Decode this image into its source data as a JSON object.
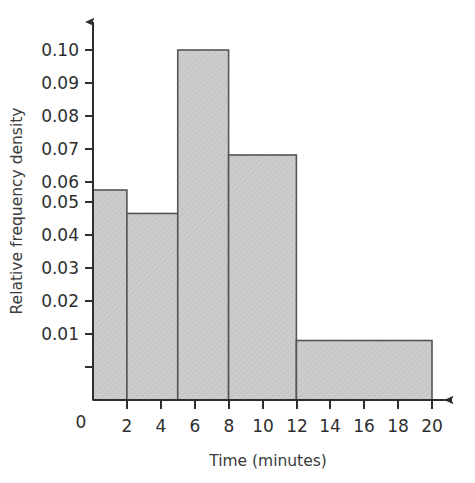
{
  "chart_data": {
    "type": "bar",
    "title": "",
    "subtitle": "",
    "xlabel": "Time (minutes)",
    "ylabel": "Relative frequency density",
    "xlim": [
      0,
      20
    ],
    "ylim": [
      0,
      0.105
    ],
    "grid": false,
    "legend": null,
    "x_tick_labels": [
      "2",
      "4",
      "6",
      "8",
      "10",
      "12",
      "14",
      "16",
      "18",
      "20"
    ],
    "x_tick_values": [
      2,
      4,
      6,
      8,
      10,
      12,
      14,
      16,
      18,
      20
    ],
    "y_tick_labels": [
      "0.01",
      "0.02",
      "0.03",
      "0.04",
      "0.05",
      "0.06",
      "0.07",
      "0.08",
      "0.09",
      "0.10"
    ],
    "y_tick_values": [
      0.01,
      0.02,
      0.03,
      0.04,
      0.05,
      0.06,
      0.07,
      0.08,
      0.09,
      0.1
    ],
    "origin_label": "0",
    "bins": [
      {
        "x0": 0,
        "x1": 2,
        "value": 0.06
      },
      {
        "x0": 2,
        "x1": 5,
        "value": 0.0533
      },
      {
        "x0": 5,
        "x1": 8,
        "value": 0.1
      },
      {
        "x0": 8,
        "x1": 12,
        "value": 0.07
      },
      {
        "x0": 12,
        "x1": 20,
        "value": 0.017
      }
    ],
    "categories": [
      "0-2",
      "2-5",
      "5-8",
      "8-12",
      "12-20"
    ],
    "values": [
      0.06,
      0.0533,
      0.1,
      0.07,
      0.017
    ],
    "colors": {
      "bar_fill": "#cdcdcd",
      "bar_stroke": "#555555",
      "axis": "#2e2e2e",
      "text": "#2e2e2e",
      "background": "#ffffff"
    }
  }
}
